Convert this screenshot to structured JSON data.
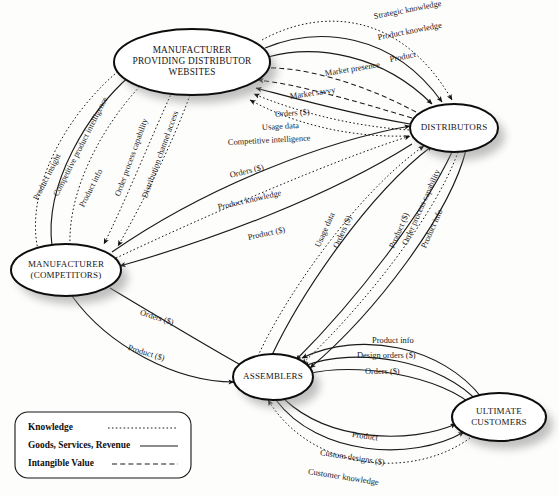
{
  "diagram": {
    "background_color": "#fdfdfc",
    "line_color": "#1a1a1a",
    "node_fill": "#ffffff",
    "shadow_color": "#8e8e8e"
  },
  "nodes": [
    {
      "id": "mpdw",
      "lines": [
        "MANUFACTURER",
        "PROVIDING DISTRIBUTOR",
        "WEBSITES"
      ],
      "cx": 192,
      "cy": 62,
      "rx": 78,
      "ry": 33
    },
    {
      "id": "distributors",
      "lines": [
        "DISTRIBUTORS"
      ],
      "cx": 454,
      "cy": 128,
      "rx": 44,
      "ry": 24
    },
    {
      "id": "competitors",
      "lines": [
        "MANUFACTURER",
        "(COMPETITORS)"
      ],
      "cx": 66,
      "cy": 270,
      "rx": 55,
      "ry": 26
    },
    {
      "id": "assemblers",
      "lines": [
        "ASSEMBLERS"
      ],
      "cx": 273,
      "cy": 377,
      "rx": 40,
      "ry": 23
    },
    {
      "id": "customers",
      "lines": [
        "ULTIMATE",
        "CUSTOMERS"
      ],
      "cx": 499,
      "cy": 417,
      "rx": 47,
      "ry": 24
    }
  ],
  "legend": {
    "items": [
      {
        "label": "Knowledge",
        "style": "knowledge"
      },
      {
        "label": "Goods, Services, Revenue",
        "style": "goods"
      },
      {
        "label": "Intangible Value",
        "style": "intangible"
      }
    ]
  },
  "edges": [
    {
      "label": "Strategic knowledge",
      "from": "mpdw",
      "to": "distributors",
      "style": "knowledge",
      "lx": 374,
      "ly": 17,
      "rot": -11
    },
    {
      "label": "Product knowledge",
      "from": "mpdw",
      "to": "distributors",
      "style": "goods",
      "lx": 378,
      "ly": 38,
      "rot": -11
    },
    {
      "label": "Product",
      "from": "mpdw",
      "to": "distributors",
      "style": "goods",
      "lx": 390,
      "ly": 60,
      "rot": -11
    },
    {
      "label": "Market presence",
      "from": "distributors",
      "to": "mpdw",
      "style": "intangible",
      "lx": 325,
      "ly": 74,
      "rot": -9
    },
    {
      "label": "Market savvy",
      "from": "distributors",
      "to": "mpdw",
      "style": "intangible",
      "lx": 290,
      "ly": 97,
      "rot": -8
    },
    {
      "label": "Orders ($)",
      "from": "distributors",
      "to": "mpdw",
      "style": "goods",
      "lx": 275,
      "ly": 115,
      "rot": -4
    },
    {
      "label": "Usage data",
      "from": "distributors",
      "to": "mpdw",
      "style": "knowledge",
      "lx": 262,
      "ly": 128,
      "rot": -3
    },
    {
      "label": "Competitive intelligence",
      "from": "distributors",
      "to": "mpdw",
      "style": "knowledge",
      "lx": 228,
      "ly": 143,
      "rot": -3
    },
    {
      "label": "Product insight",
      "from": "competitors",
      "to": "mpdw",
      "style": "knowledge",
      "lx": 36,
      "ly": 200,
      "rot": -63
    },
    {
      "label": "Competitive product intelligence",
      "from": "competitors",
      "to": "mpdw",
      "style": "goods",
      "lx": 56,
      "ly": 196,
      "rot": -63
    },
    {
      "label": "Product info",
      "from": "competitors",
      "to": "mpdw",
      "style": "knowledge",
      "lx": 82,
      "ly": 207,
      "rot": -63
    },
    {
      "label": "Order process capability",
      "from": "mpdw",
      "to": "competitors",
      "style": "knowledge",
      "lx": 118,
      "ly": 196,
      "rot": -70
    },
    {
      "label": "Distribution channel access",
      "from": "mpdw",
      "to": "competitors",
      "style": "knowledge",
      "lx": 145,
      "ly": 198,
      "rot": -70
    },
    {
      "label": "Orders ($)",
      "from": "competitors",
      "to": "distributors",
      "style": "goods",
      "lx": 230,
      "ly": 176,
      "rot": -14
    },
    {
      "label": "Product knowledge",
      "from": "competitors",
      "to": "distributors",
      "style": "knowledge",
      "lx": 218,
      "ly": 208,
      "rot": -13
    },
    {
      "label": "Product ($)",
      "from": "distributors",
      "to": "competitors",
      "style": "goods",
      "lx": 248,
      "ly": 238,
      "rot": -12
    },
    {
      "label": "Usage data",
      "from": "assemblers",
      "to": "distributors",
      "style": "knowledge",
      "lx": 318,
      "ly": 247,
      "rot": -66
    },
    {
      "label": "Orders ($)",
      "from": "assemblers",
      "to": "distributors",
      "style": "goods",
      "lx": 336,
      "ly": 248,
      "rot": -66
    },
    {
      "label": "Product ($)",
      "from": "distributors",
      "to": "assemblers",
      "style": "goods",
      "lx": 392,
      "ly": 248,
      "rot": -66
    },
    {
      "label": "Order process capability",
      "from": "distributors",
      "to": "assemblers",
      "style": "knowledge",
      "lx": 405,
      "ly": 245,
      "rot": -66
    },
    {
      "label": "Product info",
      "from": "distributors",
      "to": "assemblers",
      "style": "goods",
      "lx": 424,
      "ly": 248,
      "rot": -66
    },
    {
      "label": "Orders ($)",
      "from": "competitors",
      "to": "assemblers",
      "style": "goods",
      "lx": 140,
      "ly": 313,
      "rot": 17
    },
    {
      "label": "Product ($)",
      "from": "competitors",
      "to": "assemblers",
      "style": "goods",
      "lx": 128,
      "ly": 348,
      "rot": 17
    },
    {
      "label": "Product info",
      "from": "customers",
      "to": "assemblers",
      "style": "goods",
      "lx": 372,
      "ly": 341,
      "rot": 0
    },
    {
      "label": "Design orders ($)",
      "from": "customers",
      "to": "assemblers",
      "style": "goods",
      "lx": 357,
      "ly": 356,
      "rot": 0
    },
    {
      "label": "Orders ($)",
      "from": "customers",
      "to": "assemblers",
      "style": "goods",
      "lx": 365,
      "ly": 372,
      "rot": 0
    },
    {
      "label": "Product",
      "from": "assemblers",
      "to": "customers",
      "style": "goods",
      "lx": 352,
      "ly": 435,
      "rot": 8
    },
    {
      "label": "Custom designs ($)",
      "from": "assemblers",
      "to": "customers",
      "style": "goods",
      "lx": 320,
      "ly": 453,
      "rot": 9
    },
    {
      "label": "Customer knowledge",
      "from": "customers",
      "to": "assemblers",
      "style": "knowledge",
      "lx": 308,
      "ly": 472,
      "rot": 9
    }
  ]
}
